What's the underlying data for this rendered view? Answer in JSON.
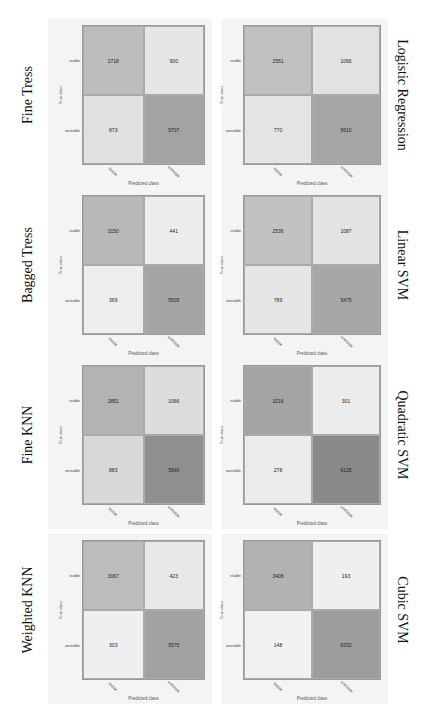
{
  "chart_data": [
    {
      "type": "heatmap",
      "title": "Fine Tress",
      "xlabel": "Predicted class",
      "ylabel": "True class",
      "row_labels": [
        "stable",
        "unstable"
      ],
      "col_labels": [
        "stable",
        "unstable"
      ],
      "values": [
        [
          2718,
          900
        ],
        [
          873,
          5707
        ]
      ]
    },
    {
      "type": "heatmap",
      "title": "Bagged Tress",
      "xlabel": "Predicted class",
      "ylabel": "True class",
      "row_labels": [
        "stable",
        "unstable"
      ],
      "col_labels": [
        "stable",
        "unstable"
      ],
      "values": [
        [
          3150,
          441
        ],
        [
          369,
          5505
        ]
      ]
    },
    {
      "type": "heatmap",
      "title": "Fine KNN",
      "xlabel": "Predicted class",
      "ylabel": "True class",
      "row_labels": [
        "stable",
        "unstable"
      ],
      "col_labels": [
        "stable",
        "unstable"
      ],
      "values": [
        [
          2851,
          1066
        ],
        [
          883,
          5540
        ]
      ]
    },
    {
      "type": "heatmap",
      "title": "Weighted  KNN",
      "xlabel": "Predicted class",
      "ylabel": "True class",
      "row_labels": [
        "stable",
        "unstable"
      ],
      "col_labels": [
        "stable",
        "unstable"
      ],
      "values": [
        [
          3067,
          423
        ],
        [
          303,
          5575
        ]
      ]
    },
    {
      "type": "heatmap",
      "title": "Logistic  Regression",
      "xlabel": "Predicted class",
      "ylabel": "True class",
      "row_labels": [
        "stable",
        "unstable"
      ],
      "col_labels": [
        "stable",
        "unstable"
      ],
      "values": [
        [
          2551,
          1066
        ],
        [
          770,
          5610
        ]
      ]
    },
    {
      "type": "heatmap",
      "title": "Linear SVM",
      "xlabel": "Predicted class",
      "ylabel": "True class",
      "row_labels": [
        "stable",
        "unstable"
      ],
      "col_labels": [
        "stable",
        "unstable"
      ],
      "values": [
        [
          2536,
          1087
        ],
        [
          789,
          5475
        ]
      ]
    },
    {
      "type": "heatmap",
      "title": "Quadratic  SVM",
      "xlabel": "Predicted class",
      "ylabel": "True class",
      "row_labels": [
        "stable",
        "unstable"
      ],
      "col_labels": [
        "stable",
        "unstable"
      ],
      "values": [
        [
          3216,
          301
        ],
        [
          278,
          6135
        ]
      ]
    },
    {
      "type": "heatmap",
      "title": "Cubic SVM",
      "xlabel": "Predicted class",
      "ylabel": "True class",
      "row_labels": [
        "stable",
        "unstable"
      ],
      "col_labels": [
        "stable",
        "unstable"
      ],
      "values": [
        [
          3408,
          193
        ],
        [
          148,
          6332
        ]
      ]
    }
  ],
  "panels": [
    {
      "title": "Fine Tress",
      "side": "left",
      "cells": [
        "2718",
        "900",
        "873",
        "5707"
      ],
      "colors": [
        "#bdbdbd",
        "#e6e6e6",
        "#e0e0e0",
        "#a3a3a3"
      ]
    },
    {
      "title": "Bagged Tress",
      "side": "left",
      "cells": [
        "3150",
        "441",
        "369",
        "5505"
      ],
      "colors": [
        "#b8b8b8",
        "#ececec",
        "#eeeeee",
        "#a5a5a5"
      ]
    },
    {
      "title": "Fine KNN",
      "side": "left",
      "cells": [
        "2851",
        "1066",
        "883",
        "5540"
      ],
      "colors": [
        "#b3b3b3",
        "#dddddd",
        "#d8d8d8",
        "#8f8f8f"
      ]
    },
    {
      "title": "Weighted  KNN",
      "side": "left",
      "cells": [
        "3067",
        "423",
        "303",
        "5575"
      ],
      "colors": [
        "#bcbcbc",
        "#e8e8e8",
        "#efefef",
        "#a2a2a2"
      ]
    },
    {
      "title": "Logistic  Regression",
      "side": "right",
      "cells": [
        "2551",
        "1066",
        "770",
        "5610"
      ],
      "colors": [
        "#c0c0c0",
        "#e2e2e2",
        "#e4e4e4",
        "#a6a6a6"
      ]
    },
    {
      "title": "Linear SVM",
      "side": "right",
      "cells": [
        "2536",
        "1087",
        "789",
        "5475"
      ],
      "colors": [
        "#c2c2c2",
        "#e3e3e3",
        "#e6e6e6",
        "#a7a7a7"
      ]
    },
    {
      "title": "Quadratic  SVM",
      "side": "right",
      "cells": [
        "3216",
        "301",
        "278",
        "6135"
      ],
      "colors": [
        "#a4a4a4",
        "#ececec",
        "#ebebeb",
        "#8a8a8a"
      ]
    },
    {
      "title": "Cubic SVM",
      "side": "right",
      "cells": [
        "3408",
        "193",
        "148",
        "6332"
      ],
      "colors": [
        "#b2b2b2",
        "#efefef",
        "#f1f1f1",
        "#9d9d9d"
      ]
    }
  ],
  "labels": {
    "xaxis": "Predicted class",
    "yaxis": "True class",
    "row_stable": "stable",
    "row_unstable": "unstable",
    "col_stable": "stable",
    "col_unstable": "unstable"
  }
}
